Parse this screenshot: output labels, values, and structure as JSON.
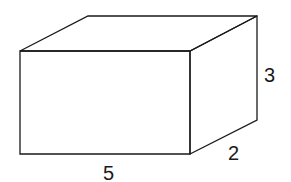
{
  "figure": {
    "type": "rectangular-prism",
    "dimensions": {
      "length": "5",
      "width": "2",
      "height": "3"
    },
    "labels": {
      "length_label": "5",
      "width_label": "2",
      "height_label": "3"
    },
    "colors": {
      "stroke": "#1a1a1a",
      "background": "#ffffff"
    }
  }
}
